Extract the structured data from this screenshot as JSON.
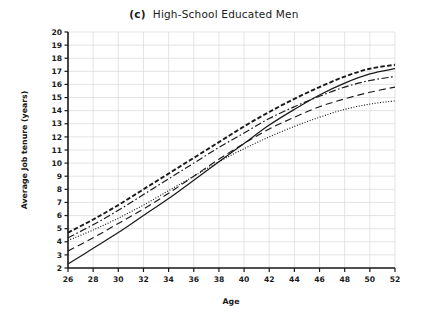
{
  "figure": {
    "panel_letter": "(c)",
    "title": "High-School Educated Men"
  },
  "chart_data": {
    "type": "line",
    "xlabel": "Age",
    "ylabel": "Average Job tenure (years)",
    "xlim": [
      26,
      52
    ],
    "ylim": [
      2,
      20
    ],
    "xticks": [
      26,
      28,
      30,
      32,
      34,
      36,
      38,
      40,
      42,
      44,
      46,
      48,
      50,
      52
    ],
    "yticks": [
      2,
      3,
      4,
      5,
      6,
      7,
      8,
      9,
      10,
      11,
      12,
      13,
      14,
      15,
      16,
      17,
      18,
      19,
      20
    ],
    "grid": true,
    "legend_position": "none",
    "line_color": "#1a1a1a",
    "grid_color": "#d9d9d9",
    "x": [
      26,
      28,
      30,
      32,
      34,
      36,
      38,
      40,
      42,
      44,
      46,
      48,
      50,
      52
    ],
    "series": [
      {
        "name": "solid",
        "dash": "solid",
        "values": [
          2.3,
          3.5,
          4.7,
          6.0,
          7.3,
          8.7,
          10.1,
          11.5,
          12.9,
          14.1,
          15.2,
          16.1,
          16.8,
          17.2
        ]
      },
      {
        "name": "long-dash",
        "dash": "long-dash",
        "values": [
          3.3,
          4.3,
          5.4,
          6.5,
          7.7,
          9.0,
          10.3,
          11.5,
          12.6,
          13.5,
          14.3,
          14.9,
          15.4,
          15.8
        ]
      },
      {
        "name": "fine-dotted",
        "dash": "fine-dotted",
        "values": [
          4.1,
          4.9,
          5.8,
          6.8,
          7.9,
          9.0,
          10.1,
          11.1,
          12.0,
          12.8,
          13.5,
          14.1,
          14.5,
          14.75
        ]
      },
      {
        "name": "dash-dot",
        "dash": "dash-dot",
        "values": [
          4.3,
          5.3,
          6.4,
          7.6,
          8.8,
          10.0,
          11.2,
          12.3,
          13.4,
          14.3,
          15.1,
          15.8,
          16.3,
          16.6
        ]
      },
      {
        "name": "thick-dash",
        "dash": "thick-dash",
        "values": [
          4.7,
          5.7,
          6.8,
          8.0,
          9.2,
          10.4,
          11.6,
          12.8,
          13.9,
          14.9,
          15.8,
          16.6,
          17.2,
          17.5
        ]
      }
    ]
  }
}
